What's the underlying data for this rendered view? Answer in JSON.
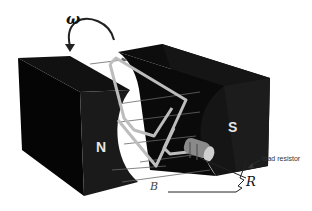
{
  "diagram": {
    "labels": {
      "angular_velocity": "ω",
      "north_pole": "N",
      "south_pole": "S",
      "magnetic_field": "B",
      "resistor_symbol": "R",
      "resistor_caption": "load resistor"
    },
    "colors": {
      "magnet": "#0a0a0a",
      "magnet_face": "#1c1c1c",
      "coil": "#b8b8b8",
      "field_lines": "#555555",
      "background": "#ffffff"
    },
    "components": [
      "north magnet",
      "south magnet",
      "rotating wire loop",
      "slip rings",
      "circuit wires",
      "load resistor"
    ]
  }
}
